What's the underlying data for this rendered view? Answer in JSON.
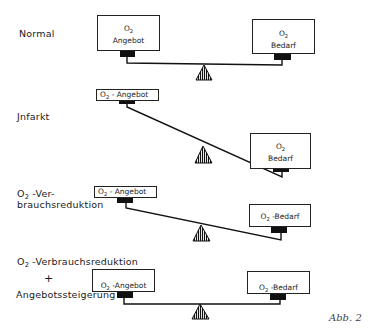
{
  "figure": {
    "caption": "Abb. 2",
    "colors": {
      "ink": "#1a1a1a",
      "background": "#ffffff"
    }
  },
  "scenarios": [
    {
      "label_lines": [
        "Normal"
      ],
      "left_box": {
        "lines": [
          "O",
          "Angebot"
        ],
        "sub": "2",
        "style": "stacked"
      },
      "right_box": {
        "lines": [
          "O",
          "Bedarf"
        ],
        "sub": "2",
        "style": "stacked"
      },
      "balance": "level"
    },
    {
      "label_lines": [
        "Jnfarkt"
      ],
      "left_box": {
        "prefix": "O",
        "sub": "2",
        "text": " - Angebot",
        "style": "inline"
      },
      "right_box": {
        "lines": [
          "O",
          "Bedarf"
        ],
        "sub": "2",
        "style": "stacked"
      },
      "balance": "tilted-right-down"
    },
    {
      "label_lines": [
        "O",
        " -Ver-",
        "brauchsreduktion"
      ],
      "label_sub": "2",
      "left_box": {
        "prefix": "O",
        "sub": "2",
        "text": " - Angebot",
        "style": "inline"
      },
      "right_box": {
        "prefix": "O",
        "sub": "2",
        "text": " -Bedarf",
        "style": "inline"
      },
      "balance": "slightly-tilted-right-down"
    },
    {
      "label_lines": [
        "O",
        " -Verbrauchsreduktion",
        "+",
        "Angebotssteigerung"
      ],
      "label_sub": "2",
      "left_box": {
        "prefix": "O",
        "sub": "2",
        "text": " -Angebot",
        "style": "inline"
      },
      "right_box": {
        "prefix": "O",
        "sub": "2",
        "text": " -Bedarf",
        "style": "inline"
      },
      "balance": "level"
    }
  ]
}
